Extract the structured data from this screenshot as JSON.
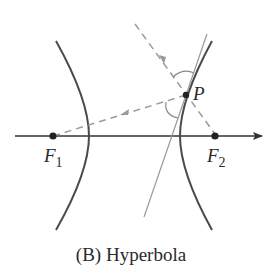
{
  "figure": {
    "caption": "(B) Hyperbola",
    "labels": {
      "focus1": "F",
      "focus1_sub": "1",
      "focus2": "F",
      "focus2_sub": "2",
      "point": "P"
    },
    "colors": {
      "curve": "#4a4a4a",
      "axis": "#333333",
      "dashed_ray": "#9a9a9a",
      "tangent": "#9a9a9a",
      "point": "#222222"
    },
    "geometry": {
      "axis": {
        "x1": 15,
        "y1": 136,
        "x2": 268,
        "y2": 136
      },
      "focus1": {
        "x": 53,
        "y": 136
      },
      "focus2": {
        "x": 215,
        "y": 136
      },
      "point_P": {
        "x": 186,
        "y": 95
      },
      "left_branch_vertex": {
        "x": 89,
        "y": 136
      },
      "right_branch_vertex": {
        "x": 180,
        "y": 136
      },
      "tangent_line": {
        "x1": 207,
        "y1": 34,
        "x2": 144,
        "y2": 217
      },
      "incoming_ray_start": {
        "x": 135,
        "y": 24
      }
    }
  }
}
